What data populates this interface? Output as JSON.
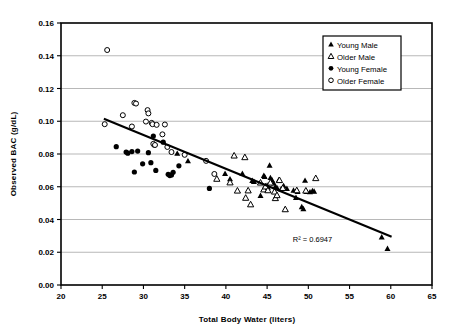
{
  "chart_data": {
    "type": "scatter",
    "title": "",
    "xlabel": "Total Body Water (liters)",
    "ylabel": "Observed BAC (g/dL)",
    "xlim": [
      20,
      65
    ],
    "ylim": [
      0.0,
      0.16
    ],
    "xticks": [
      "20",
      "25",
      "30",
      "35",
      "40",
      "45",
      "50",
      "55",
      "60",
      "65"
    ],
    "xtick_values": [
      20,
      25,
      30,
      35,
      40,
      45,
      50,
      55,
      60,
      65
    ],
    "yticks": [
      "0.00",
      "0.02",
      "0.04",
      "0.06",
      "0.08",
      "0.10",
      "0.12",
      "0.14",
      "0.16"
    ],
    "ytick_values": [
      0.0,
      0.02,
      0.04,
      0.06,
      0.08,
      0.1,
      0.12,
      0.14,
      0.16
    ],
    "grid": "horizontal",
    "legend_position": "top-right",
    "annotations": [
      {
        "text": "R² = 0.6947",
        "x": 50.5,
        "y": 0.0265
      }
    ],
    "trendline": {
      "type": "linear",
      "x_start": 25.2,
      "y_start": 0.1015,
      "x_end": 60.1,
      "y_end": 0.0295,
      "r_squared": 0.6947
    },
    "series": [
      {
        "name": "Young Male",
        "marker": "filled-triangle",
        "color": "#000000",
        "points": [
          [
            34.1,
            0.0803
          ],
          [
            35.4,
            0.0757
          ],
          [
            39.9,
            0.068
          ],
          [
            40.5,
            0.0647
          ],
          [
            42.0,
            0.068
          ],
          [
            43.2,
            0.0637
          ],
          [
            43.4,
            0.0631
          ],
          [
            44.2,
            0.0546
          ],
          [
            44.6,
            0.0668
          ],
          [
            44.7,
            0.0662
          ],
          [
            45.0,
            0.0608
          ],
          [
            45.1,
            0.0596
          ],
          [
            45.3,
            0.073
          ],
          [
            45.4,
            0.0655
          ],
          [
            45.6,
            0.064
          ],
          [
            45.8,
            0.0621
          ],
          [
            46.0,
            0.0601
          ],
          [
            46.2,
            0.0594
          ],
          [
            46.4,
            0.064
          ],
          [
            46.7,
            0.0586
          ],
          [
            47.0,
            0.0606
          ],
          [
            47.4,
            0.0588
          ],
          [
            48.2,
            0.0578
          ],
          [
            48.5,
            0.0533
          ],
          [
            48.7,
            0.057
          ],
          [
            49.2,
            0.0477
          ],
          [
            49.4,
            0.0465
          ],
          [
            49.6,
            0.0638
          ],
          [
            49.8,
            0.057
          ],
          [
            50.2,
            0.0568
          ],
          [
            50.5,
            0.0575
          ],
          [
            50.7,
            0.0572
          ],
          [
            58.9,
            0.0292
          ],
          [
            59.6,
            0.0222
          ]
        ]
      },
      {
        "name": "Older Male",
        "marker": "open-triangle",
        "color": "#000000",
        "points": [
          [
            38.9,
            0.0648
          ],
          [
            40.5,
            0.0626
          ],
          [
            41.0,
            0.079
          ],
          [
            41.4,
            0.0576
          ],
          [
            42.3,
            0.078
          ],
          [
            42.4,
            0.0532
          ],
          [
            42.7,
            0.0577
          ],
          [
            43.0,
            0.0492
          ],
          [
            44.2,
            0.0625
          ],
          [
            44.6,
            0.0583
          ],
          [
            44.8,
            0.0601
          ],
          [
            45.1,
            0.0578
          ],
          [
            45.4,
            0.0625
          ],
          [
            45.9,
            0.057
          ],
          [
            46.0,
            0.053
          ],
          [
            46.2,
            0.0548
          ],
          [
            46.5,
            0.064
          ],
          [
            46.9,
            0.0592
          ],
          [
            47.2,
            0.0462
          ],
          [
            48.6,
            0.0578
          ],
          [
            49.7,
            0.0576
          ],
          [
            50.9,
            0.0652
          ]
        ]
      },
      {
        "name": "Young Female",
        "marker": "filled-circle",
        "color": "#000000",
        "points": [
          [
            26.7,
            0.0845
          ],
          [
            27.9,
            0.0812
          ],
          [
            28.1,
            0.0805
          ],
          [
            28.6,
            0.0815
          ],
          [
            28.9,
            0.069
          ],
          [
            29.3,
            0.0818
          ],
          [
            29.9,
            0.074
          ],
          [
            30.6,
            0.0808
          ],
          [
            30.9,
            0.0747
          ],
          [
            31.2,
            0.091
          ],
          [
            31.3,
            0.0855
          ],
          [
            31.5,
            0.07
          ],
          [
            32.4,
            0.0872
          ],
          [
            33.0,
            0.0676
          ],
          [
            33.2,
            0.0668
          ],
          [
            33.4,
            0.0672
          ],
          [
            33.6,
            0.0688
          ],
          [
            34.3,
            0.0728
          ],
          [
            38.0,
            0.059
          ]
        ]
      },
      {
        "name": "Older Female",
        "marker": "open-circle",
        "color": "#000000",
        "points": [
          [
            25.3,
            0.0982
          ],
          [
            25.6,
            0.1435
          ],
          [
            27.5,
            0.1037
          ],
          [
            28.6,
            0.0968
          ],
          [
            28.9,
            0.1112
          ],
          [
            29.1,
            0.1108
          ],
          [
            30.3,
            0.0998
          ],
          [
            30.5,
            0.1068
          ],
          [
            30.6,
            0.1048
          ],
          [
            31.0,
            0.099
          ],
          [
            31.1,
            0.0982
          ],
          [
            31.2,
            0.0862
          ],
          [
            31.4,
            0.0855
          ],
          [
            31.6,
            0.0978
          ],
          [
            32.3,
            0.092
          ],
          [
            32.6,
            0.098
          ],
          [
            32.9,
            0.0843
          ],
          [
            33.4,
            0.0812
          ],
          [
            35.0,
            0.0795
          ],
          [
            37.6,
            0.0758
          ],
          [
            38.6,
            0.0678
          ]
        ]
      }
    ]
  },
  "legend": {
    "items": [
      {
        "label": "Young Male",
        "marker": "filled-triangle"
      },
      {
        "label": "Older Male",
        "marker": "open-triangle"
      },
      {
        "label": "Young Female",
        "marker": "filled-circle"
      },
      {
        "label": "Older Female",
        "marker": "open-circle"
      }
    ]
  }
}
